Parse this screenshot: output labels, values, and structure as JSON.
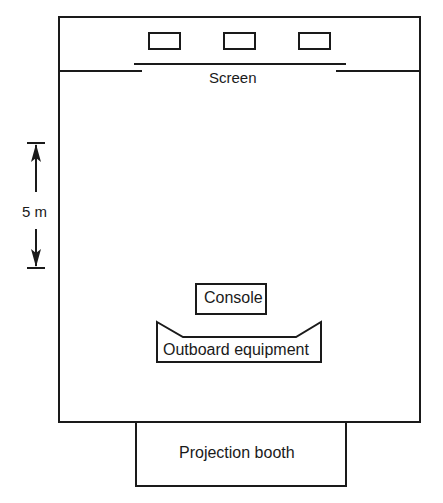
{
  "diagram": {
    "type": "floor-plan",
    "labels": {
      "screen": "Screen",
      "scale": "5 m",
      "console": "Console",
      "outboard": "Outboard equipment",
      "booth": "Projection booth"
    },
    "speakers_count": 3,
    "colors": {
      "line": "#1a1a1a",
      "background": "#ffffff"
    }
  }
}
